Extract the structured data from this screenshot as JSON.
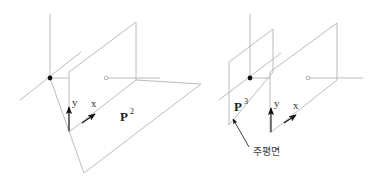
{
  "diagram": {
    "colors": {
      "line": "#b4b4b4",
      "arrow": "#111111",
      "text": "#333333",
      "background": "#ffffff"
    },
    "left_panel": {
      "axis_x_label": "x",
      "axis_y_label": "y",
      "plane_label": "P",
      "plane_superscript": "2"
    },
    "right_panel": {
      "axis_x_label": "x",
      "axis_y_label": "y",
      "plane_label": "P",
      "plane_superscript": "3",
      "callout_label": "주평면"
    }
  }
}
